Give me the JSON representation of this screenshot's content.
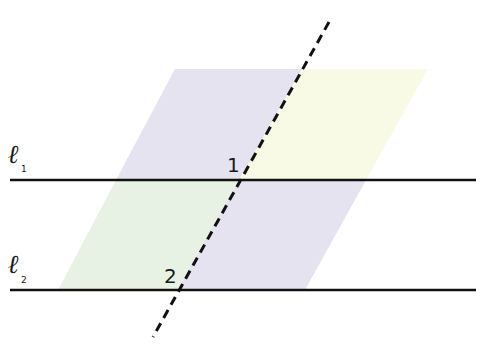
{
  "diagram": {
    "type": "parallel lines cut by a transversal",
    "lines": [
      {
        "id": "l1",
        "letter": "ℓ",
        "subscript": "1",
        "y": 180
      },
      {
        "id": "l2",
        "letter": "ℓ",
        "subscript": "2",
        "y": 290
      }
    ],
    "transversal": {
      "style": "dashed",
      "from": [
        329,
        22
      ],
      "to": [
        153,
        337
      ]
    },
    "angles": [
      {
        "label": "1",
        "position": "upper-left of intersection with ℓ1"
      },
      {
        "label": "2",
        "position": "upper-left of intersection with ℓ2"
      }
    ],
    "regions": {
      "colors": {
        "purple": "#e4e3ef",
        "yellow": "#f8fae6",
        "green": "#e8f2e4"
      }
    },
    "colors": {
      "line": "#111111",
      "background": "#ffffff"
    }
  }
}
